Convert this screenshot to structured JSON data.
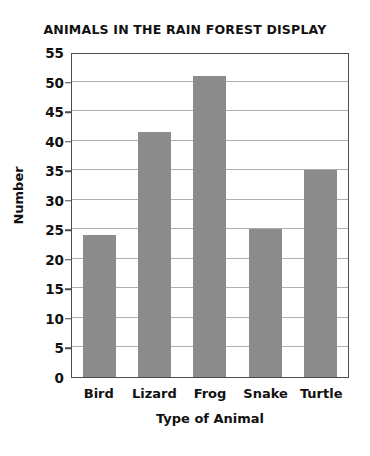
{
  "chart_data": {
    "type": "bar",
    "title": "ANIMALS IN THE RAIN FOREST DISPLAY",
    "xlabel": "Type of Animal",
    "ylabel": "Number",
    "categories": [
      "Bird",
      "Lizard",
      "Frog",
      "Snake",
      "Turtle"
    ],
    "values": [
      24,
      41.5,
      51,
      25,
      35
    ],
    "ylim": [
      0,
      55
    ],
    "ytick_labels": [
      "0",
      "5",
      "10",
      "15",
      "20",
      "25",
      "30",
      "35",
      "40",
      "45",
      "50",
      "55"
    ],
    "ytick_values": [
      0,
      5,
      10,
      15,
      20,
      25,
      30,
      35,
      40,
      45,
      50,
      55
    ],
    "grid": true,
    "legend": null,
    "bar_color": "#8c8c8c",
    "gridline_color": "#b0b0b0",
    "axis_color": "#4d4d4d",
    "background_color": "#ffffff"
  }
}
